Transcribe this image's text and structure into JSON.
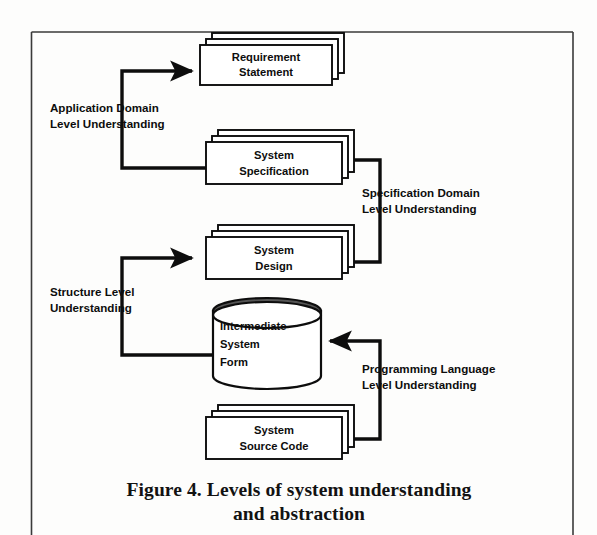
{
  "figure": {
    "caption_main": "Figure 4.  Levels of system understanding",
    "caption_second": "and abstraction",
    "frame_color": "#2b2b2b",
    "ink_color": "#0d0d0d",
    "paper_color": "#fdfdfc"
  },
  "nodes": [
    {
      "id": "requirement-statement",
      "shape": "stacked-box",
      "line1": "Requirement",
      "line2": "Statement"
    },
    {
      "id": "system-specification",
      "shape": "stacked-box",
      "line1": "System",
      "line2": "Specification"
    },
    {
      "id": "system-design",
      "shape": "stacked-box",
      "line1": "System",
      "line2": "Design"
    },
    {
      "id": "intermediate-system-form",
      "shape": "cylinder",
      "line1": "Intermediate",
      "line2": "System",
      "line3": "Form"
    },
    {
      "id": "system-source-code",
      "shape": "stacked-box",
      "line1": "System",
      "line2": "Source Code"
    }
  ],
  "edge_labels": [
    {
      "id": "application-domain",
      "line1": "Application Domain",
      "line2": "Level Understanding"
    },
    {
      "id": "specification-domain",
      "line1": "Specification Domain",
      "line2": "Level Understanding"
    },
    {
      "id": "structure-level",
      "line1": "Structure Level",
      "line2": "Understanding"
    },
    {
      "id": "programming-language",
      "line1": "Programming Language",
      "line2": "Level Understanding"
    }
  ]
}
